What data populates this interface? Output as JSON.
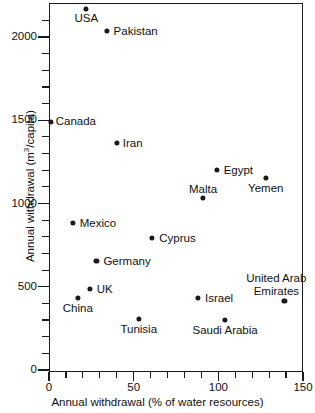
{
  "chart_data": {
    "type": "scatter",
    "title": "",
    "xlabel": "Annual withdrawal (% of water resources)",
    "ylabel": "Annual withdrawal (m³/capita)",
    "ylabel_parts": {
      "pre": "Annual withdrawal (m",
      "sup": "3",
      "post": "/capita)"
    },
    "xlim": [
      0,
      150
    ],
    "ylim": [
      0,
      2200
    ],
    "xticks_major": [
      0,
      50,
      100,
      150
    ],
    "xtick_labels": [
      "0",
      "50",
      "100",
      "150"
    ],
    "xticks_minor": [
      10,
      20,
      30,
      40,
      60,
      70,
      80,
      90,
      110,
      120,
      130,
      140
    ],
    "yticks_major": [
      0,
      500,
      1000,
      1500,
      2000
    ],
    "ytick_labels": [
      "0",
      "500",
      "1000",
      "1500",
      "2000"
    ],
    "yticks_minor": [
      100,
      200,
      300,
      400,
      600,
      700,
      800,
      900,
      1100,
      1200,
      1300,
      1400,
      1600,
      1700,
      1800,
      1900,
      2100
    ],
    "grid": false,
    "legend": false,
    "marker_color": "#1a1a1a",
    "axis_color": "#1a1a1a",
    "background": "#ffffff",
    "points": [
      {
        "label": "USA",
        "x": 22,
        "y": 2168,
        "label_pos": "below",
        "dx": 0,
        "dy": 3
      },
      {
        "label": "Pakistan",
        "x": 34,
        "y": 2036,
        "label_pos": "right",
        "dx": 7,
        "dy": 0
      },
      {
        "label": "Canada",
        "x": 1,
        "y": 1490,
        "label_pos": "right",
        "dx": 5,
        "dy": -1
      },
      {
        "label": "Iran",
        "x": 40,
        "y": 1363,
        "label_pos": "right",
        "dx": 6,
        "dy": 0
      },
      {
        "label": "Egypt",
        "x": 99,
        "y": 1200,
        "label_pos": "right",
        "dx": 7,
        "dy": 0
      },
      {
        "label": "Yemen",
        "x": 128,
        "y": 1153,
        "label_pos": "below",
        "dx": 0,
        "dy": 4
      },
      {
        "label": "Malta",
        "x": 91,
        "y": 1033,
        "label_pos": "above",
        "dx": 0,
        "dy": -3
      },
      {
        "label": "Mexico",
        "x": 14,
        "y": 883,
        "label_pos": "right",
        "dx": 7,
        "dy": 0
      },
      {
        "label": "Cyprus",
        "x": 61,
        "y": 793,
        "label_pos": "right",
        "dx": 7,
        "dy": 0
      },
      {
        "label": "Germany",
        "x": 28,
        "y": 655,
        "label_pos": "right",
        "dx": 7,
        "dy": 0
      },
      {
        "label": "UK",
        "x": 24,
        "y": 486,
        "label_pos": "right",
        "dx": 7,
        "dy": 0
      },
      {
        "label": "China",
        "x": 17,
        "y": 432,
        "label_pos": "below",
        "dx": 0,
        "dy": 4
      },
      {
        "label": "Israel",
        "x": 88,
        "y": 432,
        "label_pos": "right",
        "dx": 7,
        "dy": 0
      },
      {
        "label": "United Arab\nEmirates",
        "x": 139,
        "y": 414,
        "label_pos": "above-right",
        "dx": -8,
        "dy": -4
      },
      {
        "label": "Tunisia",
        "x": 53,
        "y": 306,
        "label_pos": "below",
        "dx": 0,
        "dy": 4
      },
      {
        "label": "Saudi Arabia",
        "x": 104,
        "y": 300,
        "label_pos": "below",
        "dx": 0,
        "dy": 4
      }
    ]
  }
}
